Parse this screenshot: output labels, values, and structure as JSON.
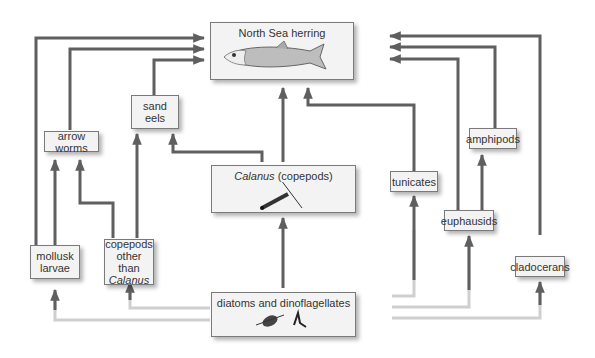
{
  "diagram": {
    "nodes": {
      "herring": {
        "label": "North Sea herring",
        "icon": "herring-fish-illustration"
      },
      "calanus": {
        "label_italic": "Calanus",
        "label_rest": "(copepods)",
        "icon": "copepod-illustration"
      },
      "diatoms": {
        "label": "diatoms and dinoflagellates",
        "icon": "phytoplankton-illustration"
      },
      "sand_eels": {
        "line1": "sand",
        "line2": "eels"
      },
      "arrow_worms": {
        "label": "arrow worms"
      },
      "mollusk_larvae": {
        "line1": "mollusk",
        "line2": "larvae"
      },
      "copepods_other": {
        "line1": "copepods",
        "line2": "other than",
        "line3_italic": "Calanus"
      },
      "tunicates": {
        "label": "tunicates"
      },
      "euphausids": {
        "label": "euphausids"
      },
      "amphipods": {
        "label": "amphipods"
      },
      "cladocerans": {
        "label": "cladocerans"
      }
    },
    "edges": [
      [
        "diatoms and dinoflagellates",
        "Calanus (copepods)"
      ],
      [
        "diatoms and dinoflagellates",
        "mollusk larvae"
      ],
      [
        "diatoms and dinoflagellates",
        "copepods other than Calanus"
      ],
      [
        "diatoms and dinoflagellates",
        "tunicates"
      ],
      [
        "diatoms and dinoflagellates",
        "euphausids"
      ],
      [
        "diatoms and dinoflagellates",
        "cladocerans"
      ],
      [
        "Calanus (copepods)",
        "North Sea herring"
      ],
      [
        "Calanus (copepods)",
        "sand eels"
      ],
      [
        "copepods other than Calanus",
        "sand eels"
      ],
      [
        "copepods other than Calanus",
        "arrow worms"
      ],
      [
        "mollusk larvae",
        "arrow worms"
      ],
      [
        "mollusk larvae",
        "North Sea herring"
      ],
      [
        "arrow worms",
        "North Sea herring"
      ],
      [
        "sand eels",
        "North Sea herring"
      ],
      [
        "tunicates",
        "North Sea herring"
      ],
      [
        "euphausids",
        "amphipods"
      ],
      [
        "euphausids",
        "North Sea herring"
      ],
      [
        "amphipods",
        "North Sea herring"
      ],
      [
        "cladocerans",
        "North Sea herring"
      ]
    ],
    "colors": {
      "arrow": "#5f5f5f",
      "box_fill": "#f3f3f3",
      "box_border": "#7a7a7a"
    }
  }
}
